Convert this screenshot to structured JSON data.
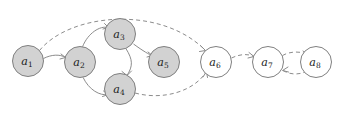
{
  "figure": {
    "name": "undirected-directed-graph-diagram",
    "background_color": "#ffffff",
    "width": 345,
    "height": 114
  },
  "style": {
    "node_fill_shaded": "#d2d2d2",
    "node_fill_hollow": "#ffffff",
    "node_stroke": "#808080",
    "edge_color": "#8c8c8c",
    "label_color": "#1a1a1a"
  },
  "nodes": [
    {
      "id": "a1",
      "base": "a",
      "sub": "1",
      "cx": 28,
      "cy": 61,
      "r": 15.5,
      "fill": "shaded"
    },
    {
      "id": "a2",
      "base": "a",
      "sub": "2",
      "cx": 80,
      "cy": 62,
      "r": 15.5,
      "fill": "shaded"
    },
    {
      "id": "a3",
      "base": "a",
      "sub": "3",
      "cx": 120,
      "cy": 34,
      "r": 15.5,
      "fill": "shaded"
    },
    {
      "id": "a4",
      "base": "a",
      "sub": "4",
      "cx": 120,
      "cy": 89,
      "r": 15.5,
      "fill": "shaded"
    },
    {
      "id": "a5",
      "base": "a",
      "sub": "5",
      "cx": 164,
      "cy": 62,
      "r": 15.5,
      "fill": "shaded"
    },
    {
      "id": "a6",
      "base": "a",
      "sub": "6",
      "cx": 216,
      "cy": 62,
      "r": 15.5,
      "fill": "hollow"
    },
    {
      "id": "a7",
      "base": "a",
      "sub": "7",
      "cx": 268,
      "cy": 62,
      "r": 15.5,
      "fill": "hollow"
    },
    {
      "id": "a8",
      "base": "a",
      "sub": "8",
      "cx": 316,
      "cy": 62,
      "r": 15.5,
      "fill": "hollow"
    }
  ],
  "edges": [
    {
      "from": "a1",
      "to": "a2",
      "style": "solid",
      "path": "M 43.3 58.6 C 51 54.5 60 54 65.5 57.5"
    },
    {
      "from": "a2",
      "to": "a3",
      "style": "solid",
      "path": "M 82.5 46.8 C 88 33 100 25.5 108 27.5"
    },
    {
      "from": "a2",
      "to": "a4",
      "style": "solid",
      "path": "M 83 77.3 C 89 90 100 96 108 94.5"
    },
    {
      "from": "a3",
      "to": "a4",
      "style": "solid",
      "path": "M 126 48.7 C 133 60 133 66 127 75.5"
    },
    {
      "from": "a3",
      "to": "a5",
      "style": "solid",
      "path": "M 133.5 44 C 143 51 150 55 152 55.5"
    },
    {
      "from": "a1",
      "to": "a6",
      "style": "dashed",
      "path": "M 39.5 50.5 C 70 13 160 5 205 50"
    },
    {
      "from": "a4",
      "to": "a6",
      "style": "dashed",
      "path": "M 135 93 C 165 101 195 90 206 72"
    },
    {
      "from": "a6",
      "to": "a7",
      "style": "dashed",
      "path": "M 231.5 58 C 240 54 248 53.5 253.5 56.5"
    },
    {
      "from": "a7",
      "to": "a8",
      "style": "dashed",
      "path": "M 282.5 55.5 C 290 51 302 51 308 55"
    },
    {
      "from": "a8",
      "to": "a7",
      "style": "dashed",
      "path": "M 307 71 C 300 75 290 75 283 70.5"
    }
  ],
  "arrowheads": [
    {
      "on": "a1-a6-near-a6",
      "path": "M 200.5 45.5 L 205.5 50.5 L 199.5 51.5"
    },
    {
      "on": "a4-a6-near-a6",
      "path": "M 203 77 L 206.5 71.5 L 207.5 77.5"
    },
    {
      "on": "a6-a7-near-a7",
      "path": "M 249 52.5 L 254 56.5 L 248 58"
    },
    {
      "on": "a7-a8-near-a8",
      "path": "M 303 51 L 308.5 55 L 302.5 56.5"
    },
    {
      "on": "a8-a7-near-a7",
      "path": "M 288 67 L 282.5 70.5 L 288.5 72"
    },
    {
      "on": "a2-a3-near-a3",
      "path": "M 104.5 23.5 L 108.5 27.5 L 103 29"
    },
    {
      "on": "a2-a4-near-a4",
      "path": "M 103.5 91 L 108.5 94.5 L 102.5 96.5"
    },
    {
      "on": "a3-a4-near-a4",
      "path": "M 122 71.5 L 127 75.5 L 131.5 71"
    },
    {
      "on": "a3-a5-near-a5",
      "path": "M 148 52 L 152.5 55.5 L 147 57"
    },
    {
      "on": "a1-a2-near-a2",
      "path": "M 61 54 L 65.5 57.5 L 60 59"
    }
  ]
}
